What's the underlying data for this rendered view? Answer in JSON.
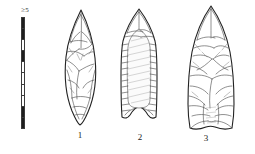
{
  "figure": {
    "type": "archaeological-line-drawing",
    "background_color": "#ffffff",
    "ink_color": "#222222"
  },
  "scale": {
    "label": "≥5",
    "orientation": "vertical",
    "segment_count": 10,
    "segment_pattern": [
      "dark",
      "light",
      "dark",
      "light",
      "dark",
      "light",
      "dark",
      "light",
      "dark",
      "light"
    ]
  },
  "artifacts": [
    {
      "number": "1",
      "name": "lanceolate-biface",
      "description": "narrow leaf-shaped biface with pointed tip and tapered base, bifacial flake scars"
    },
    {
      "number": "2",
      "name": "fluted-point",
      "description": "fluted point with parallel sides, concave base with flaring ears, central flute channel and marginal retouch"
    },
    {
      "number": "3",
      "name": "large-lanceolate-point",
      "description": "large lanceolate point with broad blade, irregular flake scars and concave ground base"
    }
  ]
}
